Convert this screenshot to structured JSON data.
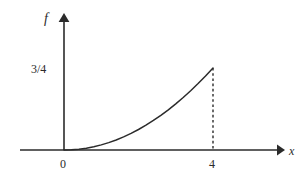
{
  "figure": {
    "background_color": "#ffffff",
    "line_color": "#2b2b2b",
    "axis_color": "#2b2b2b"
  },
  "labels": {
    "y_axis_name": "f",
    "x_axis_name": "x",
    "y_tick_value": "3/4",
    "origin": "0",
    "x_tick_value": "4"
  },
  "chart_data": {
    "type": "line",
    "title": "",
    "subtitle": "",
    "xlabel": "x",
    "ylabel": "f",
    "grid": false,
    "legend": null,
    "xlim": [
      0,
      4.8
    ],
    "ylim": [
      0,
      0.85
    ],
    "xticks": [
      0,
      4
    ],
    "xticklabels": [
      "0",
      "4"
    ],
    "yticks": [
      0.75
    ],
    "yticklabels": [
      "3/4"
    ],
    "annotations": [
      {
        "kind": "dashed-vertical-line",
        "x": 4,
        "y_from": 0,
        "y_to": 0.75
      }
    ],
    "series": [
      {
        "name": "f",
        "expression": "3*x^2/64",
        "x": [
          0,
          0.2,
          0.4,
          0.6,
          0.8,
          1.0,
          1.2,
          1.4,
          1.6,
          1.8,
          2.0,
          2.2,
          2.4,
          2.6,
          2.8,
          3.0,
          3.2,
          3.4,
          3.6,
          3.8,
          4.0
        ],
        "values": [
          0,
          0.00188,
          0.0075,
          0.01688,
          0.03,
          0.04688,
          0.0675,
          0.09188,
          0.12,
          0.15188,
          0.1875,
          0.22688,
          0.27,
          0.31688,
          0.3675,
          0.42188,
          0.48,
          0.54188,
          0.6075,
          0.67688,
          0.75
        ]
      }
    ]
  }
}
